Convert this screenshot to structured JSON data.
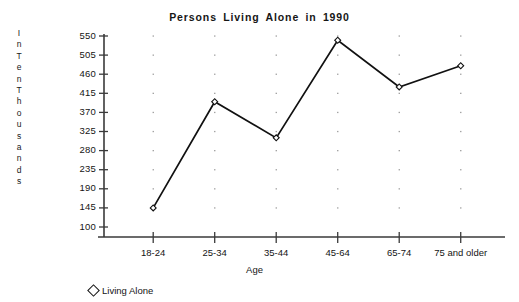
{
  "chart_data": {
    "type": "line",
    "title": "Persons  Living  Alone  in  1990",
    "xlabel": "Age",
    "ylabel": "In Ten Thousands",
    "categories": [
      "18-24",
      "25-34",
      "35-44",
      "45-64",
      "65-74",
      "75 and older"
    ],
    "series": [
      {
        "name": "Living Alone",
        "values": [
          145,
          395,
          310,
          540,
          430,
          480
        ],
        "marker": "diamond-open",
        "color": "#111111"
      }
    ],
    "ylim": [
      100,
      550
    ],
    "yticks": [
      100,
      145,
      190,
      235,
      280,
      325,
      370,
      415,
      460,
      505,
      550
    ],
    "grid": "vertical-dotted",
    "legend_position": "bottom-left",
    "legend_entries": [
      "Living Alone"
    ]
  },
  "ylabel_words": [
    "In",
    "Ten",
    "Thousands"
  ],
  "legend": {
    "marker_name": "diamond-marker",
    "label": "Living Alone"
  },
  "colors": {
    "line": "#111111",
    "axis": "#3a3a3a",
    "grid_dot": "#9a9a9a",
    "text": "#141414",
    "background": "#ffffff"
  }
}
